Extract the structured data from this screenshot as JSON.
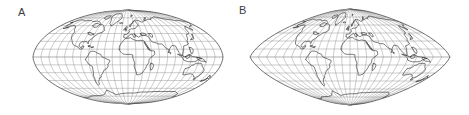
{
  "figure": {
    "type": "map-projection-comparison",
    "background_color": "#ffffff",
    "panel_count": 2
  },
  "panels": [
    {
      "label": "A",
      "projection_name": "pointed-pole pseudocylindrical (Mollweide-like / Craster parabolic)",
      "outline_shape": "lens with pointed poles and bulging curved sides",
      "graticule_interval_deg": 15,
      "parallels_deg": [
        -75,
        -60,
        -45,
        -30,
        -15,
        0,
        15,
        30,
        45,
        60,
        75
      ],
      "meridians_deg": [
        -180,
        -165,
        -150,
        -135,
        -120,
        -105,
        -90,
        -75,
        -60,
        -45,
        -30,
        -15,
        0,
        15,
        30,
        45,
        60,
        75,
        90,
        105,
        120,
        135,
        150,
        165,
        180
      ],
      "central_meridian_deg": 0,
      "pole_type": "point",
      "half_width_px": 95,
      "half_height_px": 47,
      "center_x_px": 128,
      "center_y_px": 57,
      "side_bulge": 0.88
    },
    {
      "label": "B",
      "projection_name": "sinusoidal-like pseudocylindrical",
      "outline_shape": "rhombic lens with near-straight tapering sides and pointed poles",
      "graticule_interval_deg": 15,
      "parallels_deg": [
        -75,
        -60,
        -45,
        -30,
        -15,
        0,
        15,
        30,
        45,
        60,
        75
      ],
      "meridians_deg": [
        -180,
        -165,
        -150,
        -135,
        -120,
        -105,
        -90,
        -75,
        -60,
        -45,
        -30,
        -15,
        0,
        15,
        30,
        45,
        60,
        75,
        90,
        105,
        120,
        135,
        150,
        165,
        180
      ],
      "central_meridian_deg": 0,
      "pole_type": "point",
      "half_width_px": 100,
      "half_height_px": 48,
      "center_x_px": 116,
      "center_y_px": 57,
      "side_bulge": 0.45
    }
  ],
  "colors": {
    "graticule": "#8d8d8d",
    "outline": "#4a4a4a",
    "coastline": "#2f2f2f",
    "label_text": "#3d3d3d",
    "background": "#ffffff"
  },
  "chart_data": {
    "type": "map",
    "title": "",
    "subtitle": "",
    "xlabel": "",
    "ylabel": "",
    "legend": [],
    "annotations": [
      "A",
      "B"
    ],
    "grid": true,
    "graticule_interval_deg": 15,
    "lon_range": [
      -180,
      180
    ],
    "lat_range": [
      -90,
      90
    ],
    "series": [
      {
        "name": "A",
        "projection": "pointed-pole elliptical pseudocylindrical",
        "bulge": 0.88
      },
      {
        "name": "B",
        "projection": "sinusoidal pseudocylindrical",
        "bulge": 0.45
      }
    ]
  }
}
